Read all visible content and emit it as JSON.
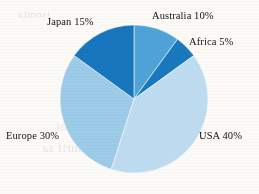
{
  "background_color": "#fbfaf7",
  "chart_data": {
    "type": "pie",
    "title": "",
    "subtitle": "",
    "xlabel": "",
    "ylabel": "",
    "legend_position": "none",
    "grid": false,
    "label_format": "{name} {value}%",
    "total": 100,
    "start_angle_deg": 0,
    "direction": "clockwise",
    "categories": [
      "Australia",
      "Africa",
      "USA",
      "Europe",
      "Japan"
    ],
    "values": [
      10,
      5,
      40,
      30,
      15
    ],
    "colors": [
      "#4fa3d8",
      "#1878c0",
      "#bedcf0",
      "#9dcce8",
      "#1876be"
    ],
    "slices": [
      {
        "name": "Australia",
        "value": 10,
        "label": "Australia 10%",
        "color": "#4fa3d8",
        "start_deg": 0,
        "end_deg": 36
      },
      {
        "name": "Africa",
        "value": 5,
        "label": "Africa 5%",
        "color": "#1878c0",
        "start_deg": 36,
        "end_deg": 54
      },
      {
        "name": "USA",
        "value": 40,
        "label": "USA 40%",
        "color": "#bedcf0",
        "start_deg": 54,
        "end_deg": 198
      },
      {
        "name": "Europe",
        "value": 30,
        "label": "Europe 30%",
        "color": "#9dcce8",
        "start_deg": 198,
        "end_deg": 306
      },
      {
        "name": "Japan",
        "value": 15,
        "label": "Japan 15%",
        "color": "#1876be",
        "start_deg": 306,
        "end_deg": 360
      }
    ]
  },
  "geometry": {
    "center_x": 134,
    "center_y": 99,
    "radius": 74
  },
  "background_ghost_text": {
    "line_1": "noitnevnoc fo segami",
    "line_2": "tib a sa ylmrif sa",
    "line_3": "erutcip",
    "line_4": "tsomla"
  }
}
